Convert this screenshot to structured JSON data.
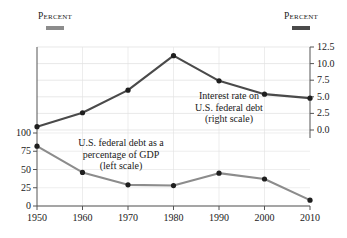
{
  "header": {
    "left_label": "Percent",
    "right_label": "Percent",
    "left_swatch_color": "#8c8c8c",
    "right_swatch_color": "#4a4a4a"
  },
  "annotations": {
    "interest": {
      "line1": "Interest rate on",
      "line2": "U.S. federal debt",
      "line3": "(right scale)"
    },
    "debt": {
      "line1": "U.S. federal debt as a",
      "line2": "percentage of GDP",
      "line3": "(left scale)"
    }
  },
  "axes": {
    "left_ticks": [
      "100",
      "75",
      "50",
      "25",
      "0"
    ],
    "right_ticks": [
      "12.5",
      "10.0",
      "7.5",
      "5.0",
      "2.5",
      "0.0"
    ],
    "x_ticks": [
      "1950",
      "1960",
      "1970",
      "1980",
      "1990",
      "2000",
      "2010"
    ]
  },
  "chart_data": {
    "type": "line",
    "title": "",
    "xlabel": "",
    "ylabel": "Percent",
    "y2label": "Percent",
    "grid": true,
    "legend_position": "in-plot annotations",
    "x": [
      1950,
      1960,
      1970,
      1980,
      1990,
      2000,
      2010
    ],
    "xlim": [
      1950,
      2010
    ],
    "ylim": [
      0,
      112.5
    ],
    "y2lim": [
      0,
      12.5
    ],
    "series": [
      {
        "name": "U.S. federal debt as a percentage of GDP (left scale)",
        "axis": "left",
        "color": "#8c8c8c",
        "values": [
          82,
          46,
          29,
          28,
          45,
          37,
          8
        ]
      },
      {
        "name": "Interest rate on U.S. federal debt (right scale)",
        "axis": "right",
        "color": "#4a4a4a",
        "values": [
          0.5,
          2.6,
          6.0,
          11.2,
          7.4,
          5.4,
          4.8
        ]
      }
    ]
  }
}
